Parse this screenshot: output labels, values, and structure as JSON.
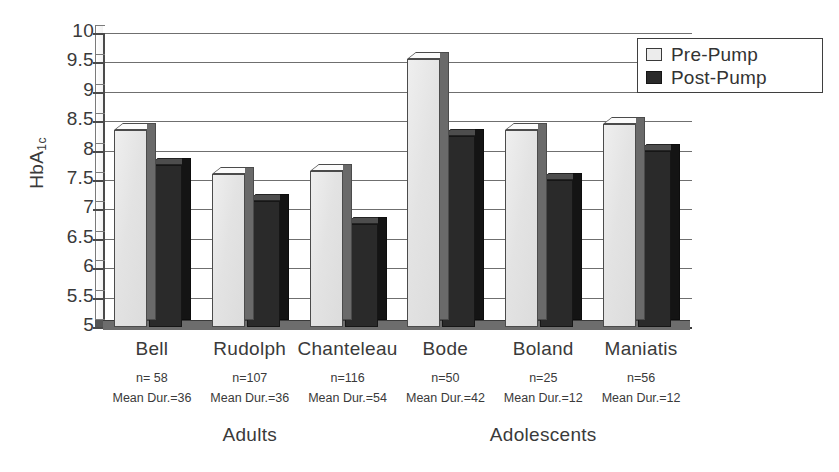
{
  "chart_data": {
    "type": "bar",
    "title": "",
    "xlabel": "",
    "ylabel": "HbA1c",
    "ylabel_main": "HbA",
    "ylabel_sub": "1c",
    "ylim": [
      5,
      10
    ],
    "ytick_step": 0.5,
    "ytick_labels": [
      "10",
      "9.5",
      "9",
      "8.5",
      "8",
      "7.5",
      "7",
      "6.5",
      "6",
      "5.5",
      "5"
    ],
    "ytick_values": [
      10,
      9.5,
      9,
      8.5,
      8,
      7.5,
      7,
      6.5,
      6,
      5.5,
      5
    ],
    "grid": true,
    "legend_position": "top-right",
    "categories": [
      "Bell",
      "Rudolph",
      "Chanteleau",
      "Bode",
      "Boland",
      "Maniatis"
    ],
    "series": [
      {
        "name": "Pre-Pump",
        "color": "#e6e6e6",
        "values": [
          8.35,
          7.6,
          7.65,
          9.55,
          8.35,
          8.45
        ]
      },
      {
        "name": "Post-Pump",
        "color": "#2a2a2a",
        "values": [
          7.75,
          7.15,
          6.75,
          8.25,
          7.5,
          8.0
        ]
      }
    ],
    "annotations": {
      "n": [
        "n= 58",
        "n=107",
        "n=116",
        "n=50",
        "n=25",
        "n=56"
      ],
      "mean_duration": [
        "Mean Dur.=36",
        "Mean Dur.=36",
        "Mean Dur.=54",
        "Mean Dur.=42",
        "Mean Dur.=12",
        "Mean Dur.=12"
      ]
    },
    "group_labels": [
      {
        "label": "Adults",
        "categories": [
          "Bell",
          "Rudolph",
          "Chanteleau"
        ]
      },
      {
        "label": "Adolescents",
        "categories": [
          "Bode",
          "Boland",
          "Maniatis"
        ]
      }
    ]
  },
  "legend": {
    "items": [
      {
        "label": "Pre-Pump",
        "swatch": "light-square-swatch"
      },
      {
        "label": "Post-Pump",
        "swatch": "dark-square-swatch"
      }
    ]
  }
}
